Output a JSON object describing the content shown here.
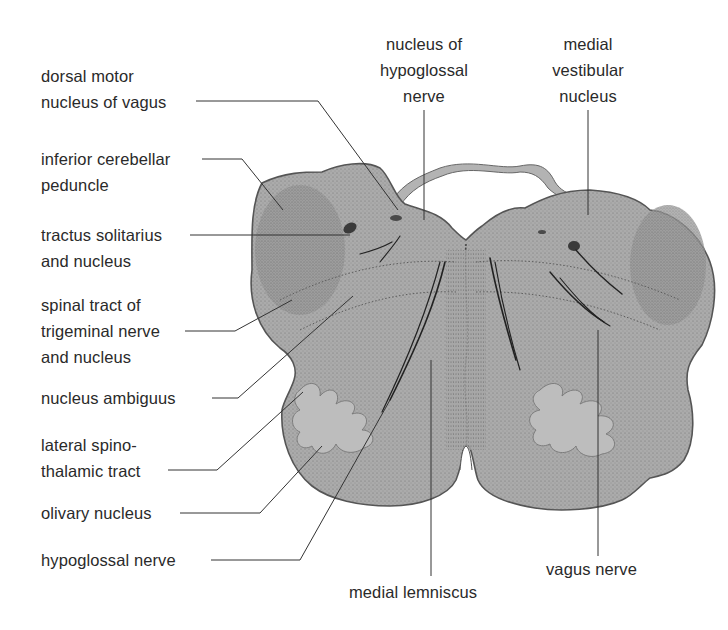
{
  "diagram": {
    "colors": {
      "tissue_fill": "#a9a9a9",
      "tissue_dark": "#8d8d8d",
      "olive_fill": "#bdbdbd",
      "outline": "#555555",
      "leader_line": "#333333",
      "background": "#ffffff"
    },
    "labels_left": [
      {
        "id": "dorsal-motor-nucleus-of-vagus",
        "lines": [
          "dorsal motor",
          "nucleus of vagus"
        ]
      },
      {
        "id": "inferior-cerebellar-peduncle",
        "lines": [
          "inferior cerebellar",
          "peduncle"
        ]
      },
      {
        "id": "tractus-solitarius-and-nucleus",
        "lines": [
          "tractus solitarius",
          "and nucleus"
        ]
      },
      {
        "id": "spinal-tract-of-trigeminal-nerve",
        "lines": [
          "spinal tract of",
          "trigeminal nerve",
          "and nucleus"
        ]
      },
      {
        "id": "nucleus-ambiguus",
        "lines": [
          "nucleus ambiguus"
        ]
      },
      {
        "id": "lateral-spinothalamic-tract",
        "lines": [
          "lateral spino-",
          "thalamic tract"
        ]
      },
      {
        "id": "olivary-nucleus",
        "lines": [
          "olivary nucleus"
        ]
      },
      {
        "id": "hypoglossal-nerve",
        "lines": [
          "hypoglossal nerve"
        ]
      }
    ],
    "labels_top": [
      {
        "id": "nucleus-of-hypoglossal-nerve",
        "lines": [
          "nucleus of",
          "hypoglossal",
          "nerve"
        ]
      },
      {
        "id": "medial-vestibular-nucleus",
        "lines": [
          "medial",
          "vestibular",
          "nucleus"
        ]
      }
    ],
    "labels_bottom": [
      {
        "id": "medial-lemniscus",
        "lines": [
          "medial lemniscus"
        ]
      },
      {
        "id": "vagus-nerve",
        "lines": [
          "vagus nerve"
        ]
      }
    ]
  }
}
